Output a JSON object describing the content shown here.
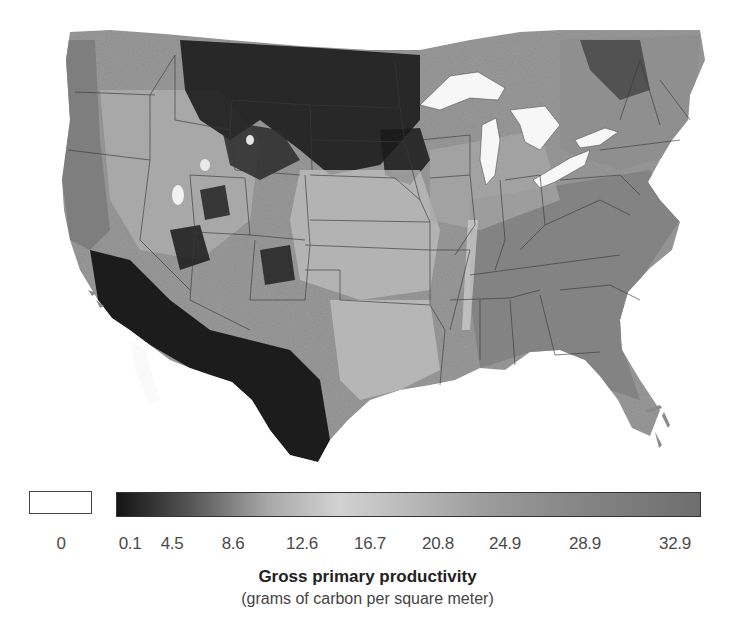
{
  "map": {
    "region": "Contiguous United States",
    "variable": "Gross primary productivity",
    "colors": {
      "no_data": "#ffffff",
      "low": "#141414",
      "mid": "#cfcfcf",
      "high": "#6e6e6e",
      "water": "#f7f7f7",
      "borders": "#3a3a3a"
    }
  },
  "legend": {
    "zero_label": "0",
    "ticks": [
      "0.1",
      "4.5",
      "8.6",
      "12.6",
      "16.7",
      "20.8",
      "24.9",
      "28.9",
      "32.9"
    ],
    "title": "Gross primary productivity",
    "subtitle": "(grams of carbon per square meter)",
    "gradient_stops": [
      {
        "value": 0.1,
        "color": "#141414"
      },
      {
        "value": 4.5,
        "color": "#5a5a5a"
      },
      {
        "value": 8.6,
        "color": "#a8a8a8"
      },
      {
        "value": 12.6,
        "color": "#d2d2d2"
      },
      {
        "value": 16.7,
        "color": "#b8b8b8"
      },
      {
        "value": 20.8,
        "color": "#9c9c9c"
      },
      {
        "value": 24.9,
        "color": "#8a8a8a"
      },
      {
        "value": 28.9,
        "color": "#7c7c7c"
      },
      {
        "value": 32.9,
        "color": "#6e6e6e"
      }
    ]
  }
}
